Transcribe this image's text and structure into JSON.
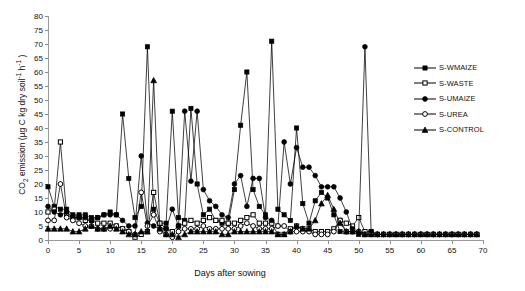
{
  "chart_data": {
    "type": "line",
    "title": "",
    "xlabel": "Days after sowing",
    "ylabel": "CO2 emission (µg C kg dry soil-1 h-1 )",
    "ylabel_parts": {
      "pre": "CO",
      "sub1": "2",
      "mid": " emission (µg C kg dry soil",
      "sup1": "-1",
      "mid2": " h",
      "sup2": "-1",
      "post": " )"
    },
    "xlim": [
      0,
      70
    ],
    "ylim": [
      0,
      80
    ],
    "xticks": [
      0,
      5,
      10,
      15,
      20,
      25,
      30,
      35,
      40,
      45,
      50,
      55,
      60,
      65,
      70
    ],
    "yticks": [
      0,
      5,
      10,
      15,
      20,
      25,
      30,
      35,
      40,
      45,
      50,
      55,
      60,
      65,
      70,
      75,
      80
    ],
    "grid": false,
    "legend_position": "right",
    "x": [
      0,
      1,
      2,
      3,
      4,
      5,
      6,
      7,
      8,
      9,
      10,
      11,
      12,
      13,
      14,
      15,
      16,
      17,
      18,
      19,
      20,
      21,
      22,
      23,
      24,
      25,
      26,
      27,
      28,
      29,
      30,
      31,
      32,
      33,
      34,
      35,
      36,
      37,
      38,
      39,
      40,
      41,
      42,
      43,
      44,
      45,
      46,
      47,
      48,
      49,
      50,
      51,
      52,
      53,
      54,
      55,
      56,
      57,
      58,
      59,
      60,
      61,
      62,
      63,
      64,
      65,
      66,
      67,
      68,
      69
    ],
    "series": [
      {
        "name": "S-WMAIZE",
        "marker": "filled-square",
        "values": [
          19,
          12,
          11,
          11,
          9,
          9,
          9,
          8,
          8,
          9,
          10,
          9,
          45,
          22,
          8,
          12,
          69,
          11,
          6,
          6,
          46,
          8,
          7,
          47,
          20,
          9,
          11,
          7,
          6,
          6,
          18,
          41,
          60,
          18,
          12,
          9,
          71,
          11,
          9,
          7,
          40,
          13,
          6,
          14,
          17,
          15,
          9,
          3,
          3,
          3,
          2,
          2,
          2,
          2,
          2,
          2,
          2,
          2,
          2,
          2,
          2,
          2,
          2,
          2,
          2,
          2,
          2,
          2,
          2,
          2
        ]
      },
      {
        "name": "S-WASTE",
        "marker": "open-square",
        "values": [
          10,
          11,
          35,
          9,
          8,
          8,
          7,
          7,
          6,
          6,
          6,
          5,
          4,
          3,
          1,
          2,
          3,
          17,
          6,
          4,
          3,
          5,
          6,
          7,
          6,
          7,
          8,
          7,
          7,
          6,
          6,
          7,
          8,
          9,
          6,
          6,
          6,
          2,
          2,
          4,
          5,
          4,
          4,
          3,
          3,
          3,
          4,
          7,
          6,
          5,
          8,
          3,
          3,
          2,
          2,
          2,
          2,
          2,
          2,
          2,
          2,
          2,
          2,
          2,
          2,
          2,
          2,
          2,
          2,
          2
        ]
      },
      {
        "name": "S-UMAIZE",
        "marker": "filled-circle",
        "values": [
          12,
          10,
          9,
          10,
          8,
          8,
          8,
          7,
          8,
          9,
          9,
          9,
          7,
          5,
          5,
          30,
          6,
          5,
          4,
          4,
          11,
          5,
          46,
          21,
          46,
          18,
          14,
          12,
          9,
          8,
          20,
          23,
          12,
          22,
          22,
          8,
          7,
          5,
          35,
          20,
          33,
          26,
          26,
          23,
          19,
          19,
          19,
          15,
          10,
          4,
          3,
          69,
          3,
          2,
          2,
          2,
          2,
          2,
          2,
          2,
          2,
          2,
          2,
          2,
          2,
          2,
          2,
          2,
          2,
          2
        ]
      },
      {
        "name": "S-UREA",
        "marker": "open-circle",
        "values": [
          7,
          7,
          20,
          8,
          7,
          6,
          5,
          5,
          4,
          4,
          4,
          5,
          4,
          3,
          2,
          17,
          5,
          9,
          3,
          2,
          1,
          3,
          4,
          4,
          4,
          5,
          4,
          4,
          4,
          4,
          4,
          5,
          6,
          5,
          4,
          4,
          4,
          5,
          5,
          3,
          3,
          3,
          3,
          2,
          2,
          2,
          3,
          7,
          3,
          3,
          3,
          2,
          2,
          2,
          2,
          2,
          2,
          2,
          2,
          2,
          2,
          2,
          2,
          2,
          2,
          2,
          2,
          2,
          2,
          2
        ]
      },
      {
        "name": "S-CONTROL",
        "marker": "filled-triangle",
        "values": [
          4,
          4,
          4,
          4,
          3,
          3,
          4,
          5,
          4,
          4,
          5,
          4,
          3,
          2,
          2,
          3,
          3,
          57,
          4,
          2,
          2,
          1,
          2,
          3,
          3,
          3,
          3,
          3,
          2,
          2,
          3,
          3,
          3,
          3,
          3,
          3,
          3,
          2,
          2,
          3,
          5,
          4,
          4,
          7,
          13,
          16,
          11,
          6,
          3,
          3,
          3,
          2,
          2,
          2,
          2,
          2,
          2,
          2,
          2,
          2,
          2,
          2,
          2,
          2,
          2,
          2,
          2,
          2,
          2,
          2
        ]
      }
    ]
  },
  "legend": {
    "items": [
      {
        "label": "S-WMAIZE"
      },
      {
        "label": "S-WASTE"
      },
      {
        "label": "S-UMAIZE"
      },
      {
        "label": "S-UREA"
      },
      {
        "label": "S-CONTROL"
      }
    ]
  }
}
